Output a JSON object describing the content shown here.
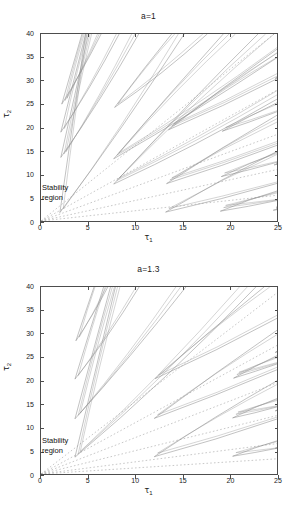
{
  "figure": {
    "background": "#ffffff",
    "axis_color": "#4d4d4d",
    "curve_color": "#8f8f8f",
    "dashed_color": "#b0b0b0"
  },
  "panels": [
    {
      "id": "panel-a",
      "title": "a=1",
      "xlabel_base": "τ",
      "xlabel_sub": "1",
      "ylabel_base": "τ",
      "ylabel_sub": "2",
      "annotation_line1": "Stability",
      "annotation_line2": "region",
      "xticks": [
        "0",
        "5",
        "10",
        "15",
        "20",
        "25"
      ],
      "yticks": [
        "0",
        "5",
        "10",
        "15",
        "20",
        "25",
        "30",
        "35",
        "40"
      ]
    },
    {
      "id": "panel-b",
      "title": "a=1.3",
      "xlabel_base": "τ",
      "xlabel_sub": "1",
      "ylabel_base": "τ",
      "ylabel_sub": "2",
      "annotation_line1": "Stability",
      "annotation_line2": "region",
      "xticks": [
        "0",
        "5",
        "10",
        "15",
        "20",
        "25"
      ],
      "yticks": [
        "0",
        "5",
        "10",
        "15",
        "20",
        "25",
        "30",
        "35",
        "40"
      ]
    }
  ],
  "chart_data": [
    {
      "type": "line",
      "title": "a=1",
      "xlabel": "τ₁",
      "ylabel": "τ₂",
      "xlim": [
        0,
        25
      ],
      "ylim": [
        0,
        40
      ],
      "xticks": [
        0,
        5,
        10,
        15,
        20,
        25
      ],
      "yticks": [
        0,
        5,
        10,
        15,
        20,
        25,
        30,
        35,
        40
      ],
      "grid": false,
      "legend": false,
      "annotations": [
        {
          "text": "Stability region",
          "x": 0.6,
          "y": 6.5
        }
      ],
      "description": "Crossing-curve stability chart: family of thin lens/wedge shaped closed contours emanating from the origin region, bounding the stability region in the lower-left corner near the origin.",
      "series": [
        {
          "name": "dashed-ray",
          "style": "dashed",
          "slope": 1.62,
          "x": [
            0,
            25
          ],
          "y": [
            0,
            40.5
          ]
        },
        {
          "name": "dashed-ray",
          "style": "dashed",
          "slope": 1.12,
          "x": [
            0,
            25
          ],
          "y": [
            0,
            28.0
          ]
        },
        {
          "name": "dashed-ray",
          "style": "dashed",
          "slope": 0.74,
          "x": [
            0,
            25
          ],
          "y": [
            0,
            18.5
          ]
        },
        {
          "name": "dashed-ray",
          "style": "dashed",
          "slope": 0.44,
          "x": [
            0,
            25
          ],
          "y": [
            0,
            11.0
          ]
        },
        {
          "name": "dashed-ray",
          "style": "dashed",
          "slope": 0.22,
          "x": [
            0,
            25
          ],
          "y": [
            0,
            5.5
          ]
        },
        {
          "name": "wedge",
          "style": "solid",
          "apex": [
            2.0,
            1.8
          ],
          "open_slope_low": 2.9,
          "open_slope_high": 14.0
        },
        {
          "name": "wedge",
          "style": "solid",
          "apex": [
            2.1,
            13.6
          ],
          "open_slope_low": 3.2,
          "open_slope_high": 9.0
        },
        {
          "name": "wedge",
          "style": "solid",
          "apex": [
            2.1,
            19.0
          ],
          "open_slope_low": 3.4,
          "open_slope_high": 8.0
        },
        {
          "name": "wedge",
          "style": "solid",
          "apex": [
            2.2,
            25.0
          ],
          "open_slope_low": 3.6,
          "open_slope_high": 7.0
        },
        {
          "name": "wedge",
          "style": "solid",
          "apex": [
            7.7,
            7.9
          ],
          "open_slope_low": 1.05,
          "open_slope_high": 2.1
        },
        {
          "name": "wedge",
          "style": "solid",
          "apex": [
            7.7,
            13.3
          ],
          "open_slope_low": 1.25,
          "open_slope_high": 2.3
        },
        {
          "name": "wedge",
          "style": "solid",
          "apex": [
            7.8,
            24.3
          ],
          "open_slope_low": 1.6,
          "open_slope_high": 2.6
        },
        {
          "name": "wedge",
          "style": "solid",
          "apex": [
            13.2,
            1.9
          ],
          "open_slope_low": 0.52,
          "open_slope_high": 1.1
        },
        {
          "name": "wedge",
          "style": "solid",
          "apex": [
            13.3,
            8.0
          ],
          "open_slope_low": 0.7,
          "open_slope_high": 1.25
        },
        {
          "name": "wedge",
          "style": "solid",
          "apex": [
            13.5,
            19.5
          ],
          "open_slope_low": 0.95,
          "open_slope_high": 1.5
        },
        {
          "name": "wedge",
          "style": "solid",
          "apex": [
            19.0,
            2.1
          ],
          "open_slope_low": 0.38,
          "open_slope_high": 0.72
        },
        {
          "name": "wedge",
          "style": "solid",
          "apex": [
            19.1,
            9.5
          ],
          "open_slope_low": 0.52,
          "open_slope_high": 0.88
        },
        {
          "name": "wedge",
          "style": "solid",
          "apex": [
            19.2,
            19.2
          ],
          "open_slope_low": 0.72,
          "open_slope_high": 1.05
        },
        {
          "name": "wedge",
          "style": "solid",
          "apex": [
            24.6,
            2.3
          ],
          "open_slope_low": 0.28,
          "open_slope_high": 0.55
        },
        {
          "name": "wedge",
          "style": "solid",
          "apex": [
            24.7,
            12.0
          ],
          "open_slope_low": 0.42,
          "open_slope_high": 0.7
        },
        {
          "name": "wedge",
          "style": "solid",
          "apex": [
            24.8,
            30.5
          ],
          "open_slope_low": 0.6,
          "open_slope_high": 0.85
        }
      ]
    },
    {
      "type": "line",
      "title": "a=1.3",
      "xlabel": "τ₁",
      "ylabel": "τ₂",
      "xlim": [
        0,
        25
      ],
      "ylim": [
        0,
        40
      ],
      "xticks": [
        0,
        5,
        10,
        15,
        20,
        25
      ],
      "yticks": [
        0,
        5,
        10,
        15,
        20,
        25,
        30,
        35,
        40
      ],
      "grid": false,
      "legend": false,
      "annotations": [
        {
          "text": "Stability region",
          "x": 0.6,
          "y": 6.5
        }
      ],
      "description": "Crossing-curve stability chart for a=1.3: same wedge family but apexes pushed further from the origin, stability region is a narrow sliver near the origin.",
      "series": [
        {
          "name": "dashed-ray",
          "style": "dashed",
          "slope": 1.55,
          "x": [
            0,
            25
          ],
          "y": [
            0,
            38.8
          ]
        },
        {
          "name": "dashed-ray",
          "style": "dashed",
          "slope": 1.1,
          "x": [
            0,
            25
          ],
          "y": [
            0,
            27.5
          ]
        },
        {
          "name": "dashed-ray",
          "style": "dashed",
          "slope": 0.78,
          "x": [
            0,
            25
          ],
          "y": [
            0,
            19.5
          ]
        },
        {
          "name": "dashed-ray",
          "style": "dashed",
          "slope": 0.5,
          "x": [
            0,
            25
          ],
          "y": [
            0,
            12.5
          ]
        },
        {
          "name": "dashed-ray",
          "style": "dashed",
          "slope": 0.26,
          "x": [
            0,
            25
          ],
          "y": [
            0,
            6.5
          ]
        },
        {
          "name": "dashed-ray",
          "style": "dashed",
          "slope": 0.13,
          "x": [
            0,
            25
          ],
          "y": [
            0,
            3.2
          ]
        },
        {
          "name": "wedge",
          "style": "solid",
          "apex": [
            3.6,
            3.6
          ],
          "open_slope_low": 1.9,
          "open_slope_high": 8.5
        },
        {
          "name": "wedge",
          "style": "solid",
          "apex": [
            3.6,
            11.8
          ],
          "open_slope_low": 2.4,
          "open_slope_high": 7.5
        },
        {
          "name": "wedge",
          "style": "solid",
          "apex": [
            3.6,
            20.3
          ],
          "open_slope_low": 2.9,
          "open_slope_high": 6.5
        },
        {
          "name": "wedge",
          "style": "solid",
          "apex": [
            3.7,
            28.5
          ],
          "open_slope_low": 3.4,
          "open_slope_high": 6.0
        },
        {
          "name": "wedge",
          "style": "solid",
          "apex": [
            12.0,
            3.7
          ],
          "open_slope_low": 0.62,
          "open_slope_high": 1.25
        },
        {
          "name": "wedge",
          "style": "solid",
          "apex": [
            12.0,
            11.9
          ],
          "open_slope_low": 0.8,
          "open_slope_high": 1.45
        },
        {
          "name": "wedge",
          "style": "solid",
          "apex": [
            12.1,
            20.4
          ],
          "open_slope_low": 1.0,
          "open_slope_high": 1.7
        },
        {
          "name": "wedge",
          "style": "solid",
          "apex": [
            20.3,
            3.8
          ],
          "open_slope_low": 0.36,
          "open_slope_high": 0.7
        },
        {
          "name": "wedge",
          "style": "solid",
          "apex": [
            20.3,
            12.0
          ],
          "open_slope_low": 0.5,
          "open_slope_high": 0.88
        },
        {
          "name": "wedge",
          "style": "solid",
          "apex": [
            20.4,
            20.5
          ],
          "open_slope_low": 0.66,
          "open_slope_high": 1.05
        },
        {
          "name": "wedge",
          "style": "solid",
          "apex": [
            24.8,
            5.5
          ],
          "open_slope_low": 0.3,
          "open_slope_high": 0.55
        },
        {
          "name": "wedge",
          "style": "solid",
          "apex": [
            24.8,
            13.5
          ],
          "open_slope_low": 0.44,
          "open_slope_high": 0.72
        },
        {
          "name": "wedge",
          "style": "solid",
          "apex": [
            24.8,
            26.0
          ],
          "open_slope_low": 0.6,
          "open_slope_high": 0.88
        }
      ]
    }
  ]
}
